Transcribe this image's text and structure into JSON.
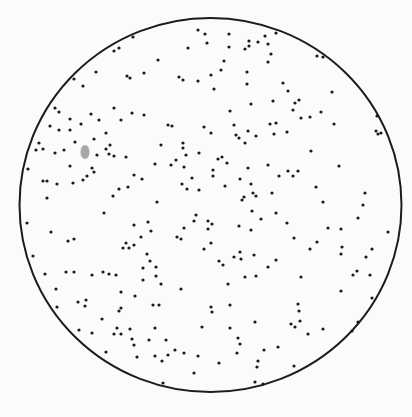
{
  "figure": {
    "background": "#fbfbf9",
    "circle": {
      "cx": 210.5,
      "cy": 205,
      "rx": 191,
      "ry": 187,
      "stroke": "#1c1c1c",
      "stroke_width": 2
    },
    "dot": {
      "r": 1.6,
      "color": "#1a1a1a"
    },
    "smudge": {
      "cx": 85,
      "cy": 152,
      "rx": 4.5,
      "ry": 7,
      "color": "#8c8c8c"
    },
    "dots": [
      [
        198,
        30
      ],
      [
        205,
        34
      ],
      [
        188,
        48
      ],
      [
        158,
        60
      ],
      [
        114,
        51
      ],
      [
        119,
        48
      ],
      [
        133,
        37
      ],
      [
        96,
        72
      ],
      [
        127,
        76
      ],
      [
        130,
        78
      ],
      [
        144,
        73
      ],
      [
        179,
        77
      ],
      [
        183,
        80
      ],
      [
        198,
        81
      ],
      [
        74,
        79
      ],
      [
        83,
        86
      ],
      [
        55,
        108
      ],
      [
        59,
        112
      ],
      [
        114,
        108
      ],
      [
        91,
        114
      ],
      [
        70,
        119
      ],
      [
        99,
        120
      ],
      [
        121,
        120
      ],
      [
        132,
        113
      ],
      [
        144,
        115
      ],
      [
        81,
        124
      ],
      [
        50,
        126
      ],
      [
        59,
        130
      ],
      [
        70,
        130
      ],
      [
        168,
        125
      ],
      [
        172,
        126
      ],
      [
        204,
        127
      ],
      [
        106,
        133
      ],
      [
        94,
        139
      ],
      [
        75,
        142
      ],
      [
        39,
        143
      ],
      [
        36,
        150
      ],
      [
        43,
        149
      ],
      [
        55,
        153
      ],
      [
        64,
        150
      ],
      [
        110,
        145
      ],
      [
        106,
        149
      ],
      [
        109,
        154
      ],
      [
        114,
        156
      ],
      [
        97,
        155
      ],
      [
        126,
        157
      ],
      [
        161,
        145
      ],
      [
        183,
        143
      ],
      [
        183,
        148
      ],
      [
        186,
        155
      ],
      [
        199,
        153
      ],
      [
        176,
        160
      ],
      [
        171,
        165
      ],
      [
        155,
        164
      ],
      [
        184,
        167
      ],
      [
        70,
        166
      ],
      [
        92,
        168
      ],
      [
        94,
        172
      ],
      [
        87,
        176
      ],
      [
        83,
        180
      ],
      [
        73,
        183
      ],
      [
        28,
        169
      ],
      [
        43,
        181
      ],
      [
        47,
        181
      ],
      [
        57,
        184
      ],
      [
        134,
        175
      ],
      [
        142,
        179
      ],
      [
        192,
        178
      ],
      [
        182,
        184
      ],
      [
        187,
        189
      ],
      [
        199,
        190
      ],
      [
        128,
        187
      ],
      [
        119,
        189
      ],
      [
        113,
        196
      ],
      [
        47,
        198
      ],
      [
        157,
        202
      ],
      [
        229,
        34
      ],
      [
        207,
        43
      ],
      [
        229,
        47
      ],
      [
        249,
        41
      ],
      [
        249,
        46
      ],
      [
        245,
        49
      ],
      [
        258,
        42
      ],
      [
        265,
        36
      ],
      [
        268,
        44
      ],
      [
        276,
        33
      ],
      [
        271,
        54
      ],
      [
        268,
        62
      ],
      [
        224,
        61
      ],
      [
        221,
        70
      ],
      [
        211,
        75
      ],
      [
        247,
        72
      ],
      [
        247,
        84
      ],
      [
        214,
        89
      ],
      [
        283,
        83
      ],
      [
        288,
        91
      ],
      [
        317,
        56
      ],
      [
        323,
        57
      ],
      [
        332,
        92
      ],
      [
        273,
        101
      ],
      [
        295,
        103
      ],
      [
        299,
        100
      ],
      [
        293,
        110
      ],
      [
        251,
        104
      ],
      [
        230,
        111
      ],
      [
        301,
        118
      ],
      [
        310,
        117
      ],
      [
        321,
        112
      ],
      [
        334,
        124
      ],
      [
        270,
        124
      ],
      [
        276,
        123
      ],
      [
        234,
        125
      ],
      [
        274,
        134
      ],
      [
        287,
        132
      ],
      [
        248,
        131
      ],
      [
        236,
        135
      ],
      [
        239,
        138
      ],
      [
        256,
        136
      ],
      [
        245,
        143
      ],
      [
        211,
        133
      ],
      [
        377,
        116
      ],
      [
        376,
        131
      ],
      [
        378,
        134
      ],
      [
        381,
        133
      ],
      [
        311,
        151
      ],
      [
        218,
        159
      ],
      [
        222,
        157
      ],
      [
        227,
        163
      ],
      [
        213,
        170
      ],
      [
        213,
        176
      ],
      [
        248,
        168
      ],
      [
        268,
        165
      ],
      [
        240,
        179
      ],
      [
        279,
        176
      ],
      [
        288,
        171
      ],
      [
        293,
        176
      ],
      [
        298,
        171
      ],
      [
        339,
        166
      ],
      [
        225,
        186
      ],
      [
        251,
        184
      ],
      [
        253,
        193
      ],
      [
        256,
        196
      ],
      [
        242,
        200
      ],
      [
        244,
        197
      ],
      [
        272,
        193
      ],
      [
        316,
        187
      ],
      [
        323,
        202
      ],
      [
        365,
        193
      ],
      [
        363,
        205
      ],
      [
        104,
        213
      ],
      [
        27,
        223
      ],
      [
        51,
        232
      ],
      [
        68,
        241
      ],
      [
        74,
        239
      ],
      [
        134,
        225
      ],
      [
        148,
        222
      ],
      [
        151,
        231
      ],
      [
        141,
        237
      ],
      [
        196,
        215
      ],
      [
        194,
        221
      ],
      [
        184,
        228
      ],
      [
        177,
        237
      ],
      [
        181,
        239
      ],
      [
        126,
        243
      ],
      [
        123,
        248
      ],
      [
        129,
        248
      ],
      [
        134,
        245
      ],
      [
        204,
        249
      ],
      [
        147,
        254
      ],
      [
        150,
        261
      ],
      [
        33,
        256
      ],
      [
        143,
        268
      ],
      [
        156,
        267
      ],
      [
        156,
        276
      ],
      [
        143,
        280
      ],
      [
        161,
        284
      ],
      [
        45,
        274
      ],
      [
        66,
        272
      ],
      [
        74,
        272
      ],
      [
        92,
        275
      ],
      [
        103,
        272
      ],
      [
        109,
        274
      ],
      [
        116,
        275
      ],
      [
        56,
        289
      ],
      [
        121,
        292
      ],
      [
        135,
        296
      ],
      [
        181,
        289
      ],
      [
        86,
        300
      ],
      [
        78,
        302
      ],
      [
        85,
        306
      ],
      [
        57,
        307
      ],
      [
        153,
        305
      ],
      [
        159,
        305
      ],
      [
        119,
        311
      ],
      [
        121,
        308
      ],
      [
        102,
        319
      ],
      [
        79,
        330
      ],
      [
        92,
        333
      ],
      [
        117,
        328
      ],
      [
        114,
        334
      ],
      [
        121,
        334
      ],
      [
        130,
        329
      ],
      [
        155,
        328
      ],
      [
        202,
        327
      ],
      [
        132,
        339
      ],
      [
        134,
        345
      ],
      [
        149,
        340
      ],
      [
        166,
        340
      ],
      [
        106,
        352
      ],
      [
        137,
        357
      ],
      [
        155,
        356
      ],
      [
        168,
        355
      ],
      [
        175,
        350
      ],
      [
        184,
        353
      ],
      [
        162,
        361
      ],
      [
        198,
        356
      ],
      [
        194,
        373
      ],
      [
        163,
        383
      ],
      [
        252,
        211
      ],
      [
        276,
        213
      ],
      [
        261,
        219
      ],
      [
        287,
        223
      ],
      [
        208,
        221
      ],
      [
        212,
        224
      ],
      [
        208,
        229
      ],
      [
        239,
        226
      ],
      [
        251,
        230
      ],
      [
        358,
        218
      ],
      [
        388,
        232
      ],
      [
        328,
        228
      ],
      [
        341,
        229
      ],
      [
        294,
        238
      ],
      [
        317,
        242
      ],
      [
        310,
        249
      ],
      [
        342,
        247
      ],
      [
        341,
        254
      ],
      [
        372,
        249
      ],
      [
        366,
        257
      ],
      [
        211,
        243
      ],
      [
        240,
        252
      ],
      [
        241,
        259
      ],
      [
        234,
        257
      ],
      [
        254,
        255
      ],
      [
        276,
        260
      ],
      [
        219,
        261
      ],
      [
        223,
        265
      ],
      [
        268,
        267
      ],
      [
        245,
        277
      ],
      [
        256,
        276
      ],
      [
        301,
        277
      ],
      [
        357,
        271
      ],
      [
        353,
        275
      ],
      [
        370,
        275
      ],
      [
        228,
        284
      ],
      [
        341,
        291
      ],
      [
        372,
        298
      ],
      [
        211,
        307
      ],
      [
        212,
        312
      ],
      [
        230,
        305
      ],
      [
        298,
        304
      ],
      [
        299,
        311
      ],
      [
        300,
        321
      ],
      [
        291,
        324
      ],
      [
        295,
        327
      ],
      [
        255,
        322
      ],
      [
        230,
        328
      ],
      [
        308,
        334
      ],
      [
        323,
        329
      ],
      [
        358,
        322
      ],
      [
        352,
        331
      ],
      [
        238,
        338
      ],
      [
        240,
        344
      ],
      [
        237,
        353
      ],
      [
        264,
        350
      ],
      [
        278,
        347
      ],
      [
        219,
        363
      ],
      [
        258,
        361
      ],
      [
        257,
        367
      ],
      [
        294,
        366
      ],
      [
        255,
        382
      ],
      [
        263,
        384
      ]
    ]
  }
}
